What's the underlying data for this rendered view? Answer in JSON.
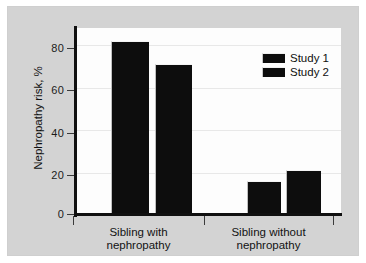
{
  "chart_data": {
    "type": "bar",
    "title": "",
    "xlabel": "",
    "ylabel": "Nephropathy risk, %",
    "ylim": [
      0,
      88
    ],
    "yticks": [
      0,
      20,
      40,
      60,
      80
    ],
    "ytick_labels": [
      "0",
      "20",
      "40",
      "60",
      "80"
    ],
    "grid": true,
    "legend_position": "top-right",
    "categories": [
      "Sibling with nephropathy",
      "Sibling without nephropathy"
    ],
    "category_lines": [
      [
        "Sibling with",
        "nephropathy"
      ],
      [
        "Sibling without",
        "nephropathy"
      ]
    ],
    "series": [
      {
        "name": "Study 1",
        "values": [
          82,
          16
        ],
        "color": "#0d0d0d"
      },
      {
        "name": "Study 2",
        "values": [
          71,
          21
        ],
        "color": "#0d0d0d"
      }
    ]
  },
  "legend": {
    "items": [
      {
        "label": "Study 1"
      },
      {
        "label": "Study 2"
      }
    ]
  },
  "colors": {
    "panel_background": "#d3d3d3",
    "plot_background": "#fdfdfd",
    "axis": "#101010",
    "gridline": "#e8e8e8",
    "bar": "#0d0d0d",
    "text": "#121212"
  }
}
